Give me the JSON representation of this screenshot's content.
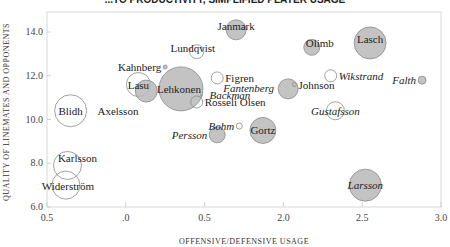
{
  "chart_data": {
    "type": "scatter",
    "subtype": "bubble",
    "title": "...TO PRODUCTIVITY, SIMPLIFIED PLAYER USAGE",
    "xlabel": "OFFENSIVE/DEFENSIVE USAGE",
    "ylabel": "QUALITY OF LINEMATES AND OPPONENTS",
    "xlim": [
      0.5,
      3.0
    ],
    "ylim": [
      6.0,
      14.0
    ],
    "x_ticks": [
      "0.5",
      ".0",
      "0.5",
      "2.0",
      "2.5",
      "3.0"
    ],
    "y_ticks": [
      "6.0",
      "8.0",
      "10.0",
      "12.0",
      "14.0"
    ],
    "grid": false,
    "legend": null,
    "points": [
      {
        "name": "Janmark",
        "x": 1.7,
        "y": 14.1,
        "r": 10,
        "filled": true,
        "italic": false
      },
      {
        "name": "Lundqvist",
        "x": 1.45,
        "y": 13.1,
        "r": 7,
        "filled": false,
        "italic": false
      },
      {
        "name": "Olimb",
        "x": 2.18,
        "y": 13.3,
        "r": 8,
        "filled": true,
        "italic": false
      },
      {
        "name": "Lasch",
        "x": 2.55,
        "y": 13.5,
        "r": 16,
        "filled": true,
        "italic": false
      },
      {
        "name": "Kahnberg",
        "x": 1.25,
        "y": 12.4,
        "r": 2,
        "filled": true,
        "italic": false
      },
      {
        "name": "Lasu",
        "x": 1.08,
        "y": 11.6,
        "r": 12,
        "filled": false,
        "italic": false
      },
      {
        "name": "Lasu-shadow",
        "x": 1.13,
        "y": 11.3,
        "r": 11,
        "filled": true,
        "italic": false,
        "label_hidden": true
      },
      {
        "name": "Lehkonen",
        "x": 1.35,
        "y": 11.4,
        "r": 22,
        "filled": true,
        "italic": false
      },
      {
        "name": "Figren",
        "x": 1.58,
        "y": 11.9,
        "r": 6,
        "filled": false,
        "italic": false
      },
      {
        "name": "Fantenberg",
        "x": 2.03,
        "y": 11.4,
        "r": 10,
        "filled": true,
        "italic": true,
        "label_only_pos": true
      },
      {
        "name": "Johnson",
        "x": 2.07,
        "y": 11.6,
        "r": 2,
        "filled": false,
        "italic": false
      },
      {
        "name": "Wikstrand",
        "x": 2.3,
        "y": 12.0,
        "r": 6,
        "filled": false,
        "italic": true
      },
      {
        "name": "Falth",
        "x": 2.88,
        "y": 11.8,
        "r": 4,
        "filled": true,
        "italic": true
      },
      {
        "name": "Backman",
        "x": 1.48,
        "y": 11.1,
        "r": 1,
        "filled": false,
        "italic": true
      },
      {
        "name": "Rosseli Olsen",
        "x": 1.45,
        "y": 10.8,
        "r": 6,
        "filled": false,
        "italic": false
      },
      {
        "name": "Axelsson",
        "x": 0.95,
        "y": 10.4,
        "r": 0,
        "filled": false,
        "italic": false
      },
      {
        "name": "Blidh",
        "x": 0.65,
        "y": 10.4,
        "r": 16,
        "filled": false,
        "italic": false
      },
      {
        "name": "Gustafsson",
        "x": 2.33,
        "y": 10.4,
        "r": 9,
        "filled": false,
        "italic": true
      },
      {
        "name": "Bohm",
        "x": 1.72,
        "y": 9.7,
        "r": 3,
        "filled": false,
        "italic": true
      },
      {
        "name": "Persson",
        "x": 1.58,
        "y": 9.3,
        "r": 8,
        "filled": true,
        "italic": true
      },
      {
        "name": "Gortz",
        "x": 1.87,
        "y": 9.5,
        "r": 13,
        "filled": true,
        "italic": false
      },
      {
        "name": "Karlsson",
        "x": 0.63,
        "y": 7.9,
        "r": 14,
        "filled": false,
        "italic": false
      },
      {
        "name": "Widerström",
        "x": 0.62,
        "y": 7.0,
        "r": 14,
        "filled": false,
        "italic": false
      },
      {
        "name": "Larsson",
        "x": 2.52,
        "y": 7.0,
        "r": 16,
        "filled": true,
        "italic": true
      }
    ]
  },
  "colors": {
    "bubble_fill": "#b8b8b8",
    "bubble_stroke": "#8a8a8a",
    "hollow_fill": "#ffffff",
    "axis": "#cfcfcf",
    "text": "#222222"
  }
}
